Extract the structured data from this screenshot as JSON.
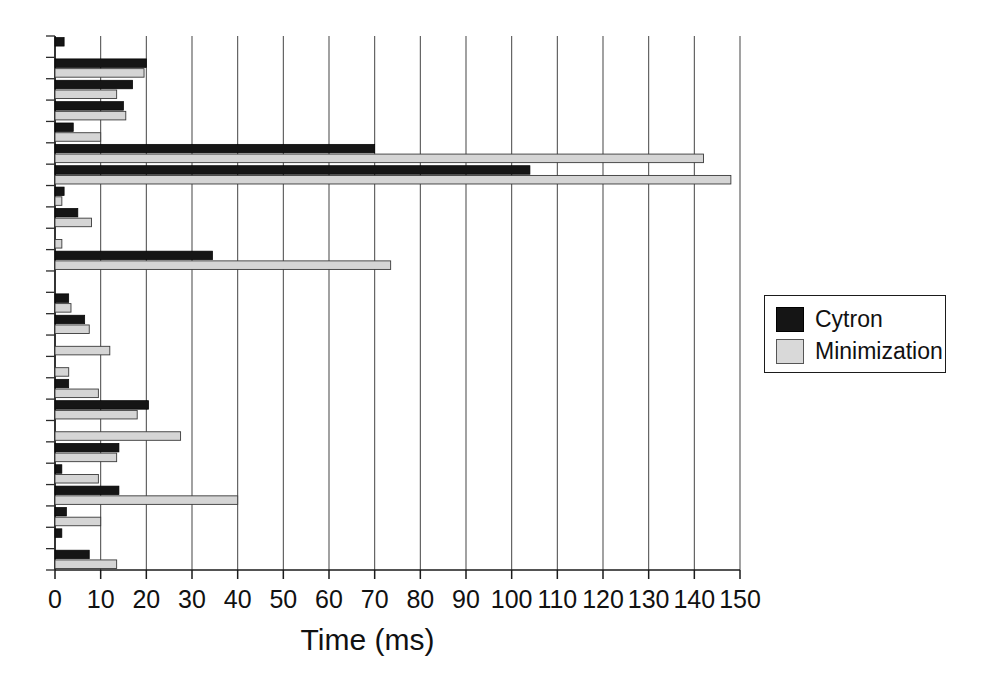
{
  "chart_data": {
    "type": "bar",
    "orientation": "horizontal",
    "title": "",
    "xlabel": "Time (ms)",
    "ylabel": "",
    "xlim": [
      0,
      150
    ],
    "xticks": [
      0,
      10,
      20,
      30,
      40,
      50,
      60,
      70,
      80,
      90,
      100,
      110,
      120,
      130,
      140,
      150
    ],
    "xtick_labels": [
      "0",
      "10",
      "20",
      "30",
      "40",
      "50",
      "60",
      "70",
      "80",
      "90",
      "100",
      "110",
      "120",
      "130",
      "140",
      "150"
    ],
    "grid": true,
    "grid_axis": "x",
    "legend": {
      "position": "right",
      "entries": [
        {
          "name": "Cytron",
          "color": "#151515"
        },
        {
          "name": "Minimization",
          "color": "#d5d5d5"
        }
      ]
    },
    "categories": [
      "1",
      "2",
      "3",
      "4",
      "5",
      "6",
      "7",
      "8",
      "9",
      "10",
      "11",
      "12",
      "13",
      "14",
      "15",
      "16",
      "17",
      "18",
      "19",
      "20",
      "21",
      "22"
    ],
    "series": [
      {
        "name": "Cytron",
        "color": "#151515",
        "values": [
          2.0,
          20.0,
          17.0,
          15.0,
          4.0,
          70.0,
          104.0,
          2.0,
          5.0,
          0.0,
          34.5,
          0.0,
          3.0,
          6.5,
          0.0,
          0.0,
          3.0,
          20.5,
          0.0,
          14.0,
          1.5,
          14.0
        ]
      },
      {
        "name": "Minimization",
        "color": "#d5d5d5",
        "values": [
          0.0,
          19.5,
          13.5,
          15.5,
          10.0,
          142.0,
          148.0,
          1.5,
          8.0,
          1.5,
          73.5,
          0.0,
          3.5,
          7.5,
          12.0,
          3.0,
          9.5,
          18.0,
          27.5,
          13.5,
          9.5,
          40.0
        ]
      }
    ],
    "extra_groups_note": "",
    "tail_groups": {
      "categories": [
        "23",
        "24",
        "25"
      ],
      "series": [
        {
          "name": "Cytron",
          "values": [
            2.5,
            1.5,
            7.5
          ]
        },
        {
          "name": "Minimization",
          "values": [
            10.0,
            0.0,
            13.5
          ]
        }
      ]
    }
  },
  "axis": {
    "x_title": "Time (ms)"
  }
}
